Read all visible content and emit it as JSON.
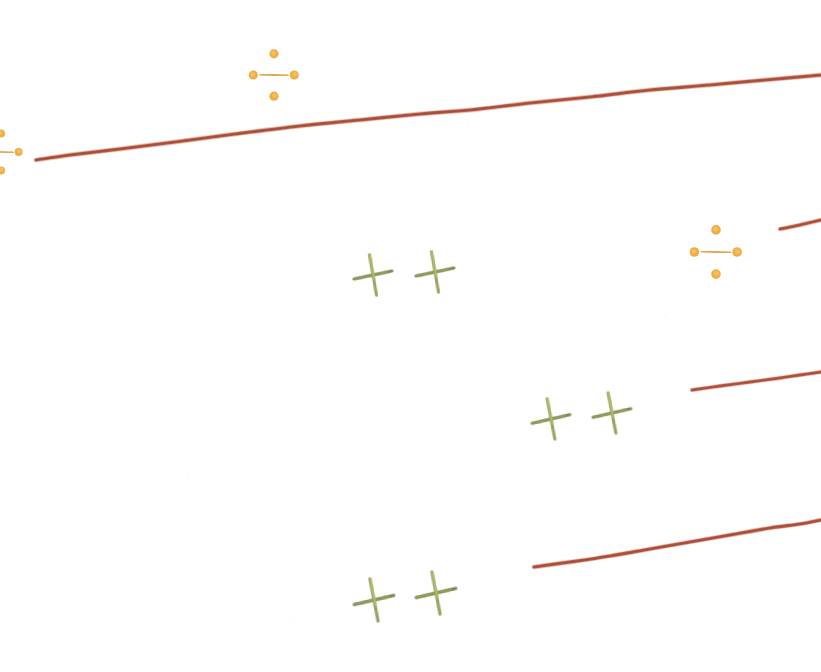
{
  "figure": {
    "medium": "scanned ink drawing on white paper",
    "width": 821,
    "height": 672,
    "background_color": "#ffffff"
  },
  "palette": {
    "line_red": "#b5553f",
    "line_red_light": "#c8765c",
    "line_red_dark": "#9c4331",
    "marker_orange": "#efa93a",
    "marker_orange_light": "#f6c266",
    "marker_orange_dark": "#d78a24",
    "marker_green": "#93a05a",
    "marker_green_light": "#b9c06e",
    "marker_green_dark": "#6d7a42"
  },
  "chart_data": {
    "type": "line",
    "xlabel": "",
    "ylabel": "",
    "xlim": [
      0,
      821
    ],
    "ylim": [
      672,
      0
    ],
    "grid": false,
    "legend": "none",
    "note": "Coordinates are pixel positions in the 821x672 image; y increases downward.",
    "series": [
      {
        "name": "top-long-line",
        "color": "#b5553f",
        "stroke_width": 3.2,
        "points": [
          [
            36,
            160
          ],
          [
            70,
            155
          ],
          [
            120,
            149
          ],
          [
            175,
            142
          ],
          [
            235,
            134
          ],
          [
            300,
            126
          ],
          [
            360,
            120
          ],
          [
            420,
            114
          ],
          [
            470,
            110
          ],
          [
            530,
            103
          ],
          [
            590,
            97
          ],
          [
            650,
            90
          ],
          [
            710,
            85
          ],
          [
            765,
            80
          ],
          [
            821,
            75
          ]
        ]
      },
      {
        "name": "right-short-line-upper",
        "color": "#b5553f",
        "stroke_width": 3.0,
        "points": [
          [
            780,
            229
          ],
          [
            795,
            226
          ],
          [
            808,
            223
          ],
          [
            821,
            220
          ]
        ]
      },
      {
        "name": "middle-right-line",
        "color": "#b5553f",
        "stroke_width": 2.8,
        "points": [
          [
            692,
            390
          ],
          [
            720,
            386
          ],
          [
            750,
            382
          ],
          [
            780,
            378
          ],
          [
            800,
            375
          ],
          [
            821,
            372
          ]
        ]
      },
      {
        "name": "bottom-right-line",
        "color": "#b5553f",
        "stroke_width": 3.2,
        "points": [
          [
            534,
            567
          ],
          [
            570,
            562
          ],
          [
            610,
            556
          ],
          [
            650,
            549
          ],
          [
            690,
            542
          ],
          [
            730,
            535
          ],
          [
            770,
            528
          ],
          [
            800,
            524
          ],
          [
            821,
            520
          ]
        ]
      }
    ],
    "markers": [
      {
        "name": "orange-cross-top-left",
        "shape": "plus-with-bulbs",
        "color": "#efa93a",
        "x": 274,
        "y": 75,
        "size": 23,
        "rotation_deg": 0
      },
      {
        "name": "orange-cross-mid-right",
        "shape": "plus-with-bulbs",
        "color": "#efa93a",
        "x": 716,
        "y": 252,
        "size": 24,
        "rotation_deg": 0
      },
      {
        "name": "orange-cross-clipped-left-edge",
        "shape": "plus-with-bulbs",
        "color": "#efa93a",
        "x": 1,
        "y": 152,
        "size": 20,
        "rotation_deg": 0
      },
      {
        "name": "green-cross-row1-left",
        "shape": "plus",
        "color": "#93a05a",
        "x": 373,
        "y": 275,
        "size": 20,
        "rotation_deg": -6
      },
      {
        "name": "green-cross-row1-right",
        "shape": "plus",
        "color": "#93a05a",
        "x": 435,
        "y": 272,
        "size": 20,
        "rotation_deg": -6
      },
      {
        "name": "green-cross-row2-left",
        "shape": "plus",
        "color": "#93a05a",
        "x": 551,
        "y": 419,
        "size": 20,
        "rotation_deg": -7
      },
      {
        "name": "green-cross-row2-right",
        "shape": "plus",
        "color": "#93a05a",
        "x": 612,
        "y": 413,
        "size": 20,
        "rotation_deg": -7
      },
      {
        "name": "green-cross-row3-left",
        "shape": "plus",
        "color": "#93a05a",
        "x": 374,
        "y": 600,
        "size": 21,
        "rotation_deg": -7
      },
      {
        "name": "green-cross-row3-right",
        "shape": "plus",
        "color": "#93a05a",
        "x": 436,
        "y": 593,
        "size": 21,
        "rotation_deg": -7
      }
    ]
  }
}
